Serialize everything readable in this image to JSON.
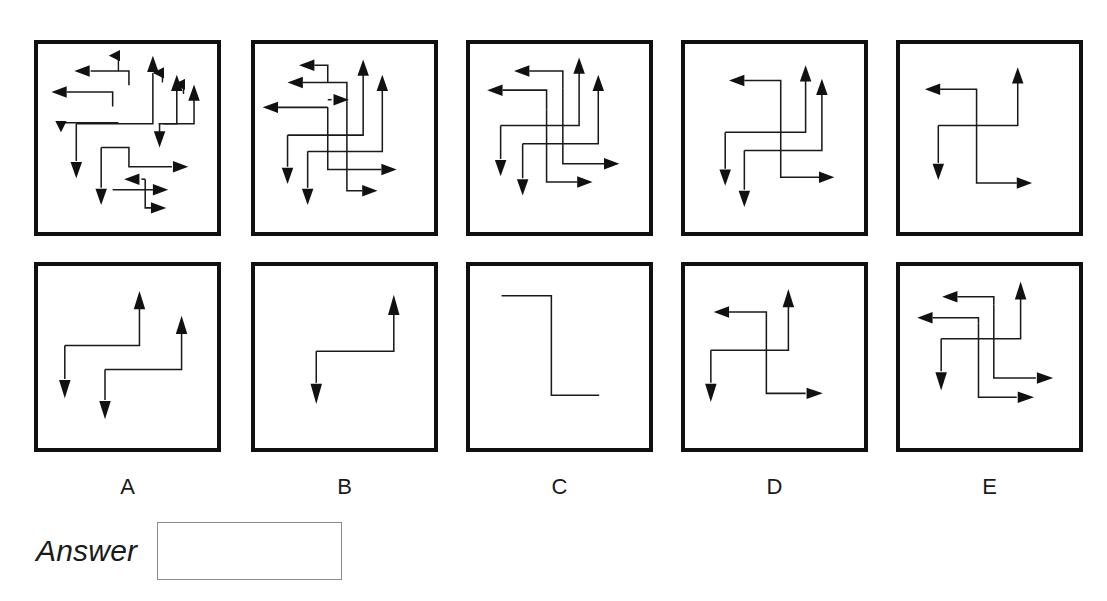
{
  "page": {
    "title_fragment": "",
    "background": "#ffffff",
    "stroke_color": "#1a1a1a",
    "frame_color": "#101010"
  },
  "answer": {
    "label": "Answer",
    "value": "",
    "placeholder": ""
  },
  "options": [
    {
      "id": "A",
      "label": "A"
    },
    {
      "id": "B",
      "label": "B"
    },
    {
      "id": "C",
      "label": "C"
    },
    {
      "id": "D",
      "label": "D"
    },
    {
      "id": "E",
      "label": "E"
    }
  ],
  "puzzle": {
    "type": "arrow-count-figure-matching",
    "rows": [
      {
        "name": "top-row",
        "panels": [
          {
            "id": "top-A",
            "arrow_count": 10,
            "description": "ten elbow arrows, dense cluster"
          },
          {
            "id": "top-B",
            "arrow_count": 9,
            "description": "nine elbow arrows"
          },
          {
            "id": "top-C",
            "arrow_count": 7,
            "description": "seven elbow arrows"
          },
          {
            "id": "top-D",
            "arrow_count": 5,
            "description": "five elbow arrows"
          },
          {
            "id": "top-E",
            "arrow_count": 3,
            "description": "three elbow arrows"
          }
        ]
      },
      {
        "name": "bottom-row",
        "panels": [
          {
            "id": "bot-A",
            "arrow_count": 4,
            "description": "four elbow arrows"
          },
          {
            "id": "bot-B",
            "arrow_count": 2,
            "description": "two elbow arrows, single Z path"
          },
          {
            "id": "bot-C",
            "arrow_count": 0,
            "description": "plain Z line, no arrowheads"
          },
          {
            "id": "bot-D",
            "arrow_count": 4,
            "description": "four elbow arrows"
          },
          {
            "id": "bot-E",
            "arrow_count": 6,
            "description": "six elbow arrows"
          }
        ]
      }
    ]
  }
}
